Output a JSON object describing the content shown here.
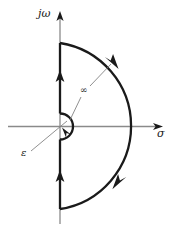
{
  "figure": {
    "background_color": "#ffffff",
    "width": 174,
    "height": 229
  },
  "axes": {
    "imaginary": {
      "label": "jω",
      "name": "imaginary-axis",
      "orientation": "vertical",
      "color": "#8a8a8a",
      "arrow_direction": "up"
    },
    "real": {
      "label": "σ",
      "name": "real-axis",
      "orientation": "horizontal",
      "color": "#8a8a8a",
      "arrow_direction": "right"
    }
  },
  "annotations": {
    "large_radius": {
      "label": "∞",
      "description": "radius of the large semicircular arc",
      "leader_from": [
        72,
        118
      ],
      "leader_to": [
        112,
        66
      ]
    },
    "small_radius": {
      "label": "ε",
      "description": "radius of the small semicircular indentation at the origin",
      "leader_from": [
        32,
        150
      ],
      "leader_to": [
        66,
        122
      ]
    }
  },
  "contour": {
    "color": "#1a1a1a",
    "stroke_width": 2.2,
    "origin": [
      60,
      126.5
    ],
    "large_arc": {
      "name": "large-semicircle",
      "radius": 84,
      "start": [
        60,
        43
      ],
      "end": [
        60,
        209
      ],
      "direction": "clockwise"
    },
    "small_arc": {
      "name": "small-semicircle",
      "radius": 13,
      "start": [
        60,
        113.5
      ],
      "end": [
        60,
        139.5
      ],
      "direction": "clockwise",
      "bulge": "right"
    },
    "upper_segment": {
      "name": "upper-imaginary-segment",
      "from": [
        60,
        113.5
      ],
      "to": [
        60,
        43
      ],
      "direction": "up"
    },
    "lower_segment": {
      "name": "lower-imaginary-segment",
      "from": [
        60,
        209
      ],
      "to": [
        60,
        139.5
      ],
      "direction": "up"
    },
    "arrowheads": [
      {
        "name": "upper-segment-arrow",
        "at": [
          60,
          76
        ],
        "points": "up"
      },
      {
        "name": "lower-segment-arrow",
        "at": [
          60,
          176
        ],
        "points": "up"
      },
      {
        "name": "upper-arc-arrow",
        "at": [
          113,
          62
        ],
        "points": "clockwise-down-right"
      },
      {
        "name": "lower-arc-arrow",
        "at": [
          119,
          181
        ],
        "points": "clockwise-down-left"
      },
      {
        "name": "small-arc-arrow",
        "at": [
          66,
          132
        ],
        "points": "clockwise-up-left"
      }
    ]
  }
}
